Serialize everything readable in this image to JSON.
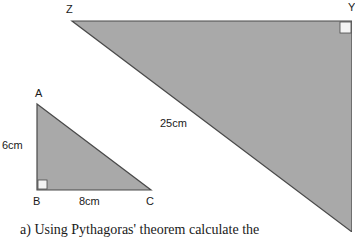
{
  "colors": {
    "fill": "#a9a9a9",
    "stroke": "#4a4a4a",
    "right_angle_fill": "#f4f4f4",
    "text": "#1a1a1a"
  },
  "large_triangle": {
    "vertices": {
      "Z": "Z",
      "Y": "Y"
    },
    "hypotenuse_label": "25cm"
  },
  "small_triangle": {
    "vertices": {
      "A": "A",
      "B": "B",
      "C": "C"
    },
    "side_AB": "6cm",
    "side_BC": "8cm"
  },
  "question": {
    "text": "a)  Using Pythagoras' theorem calculate the"
  }
}
